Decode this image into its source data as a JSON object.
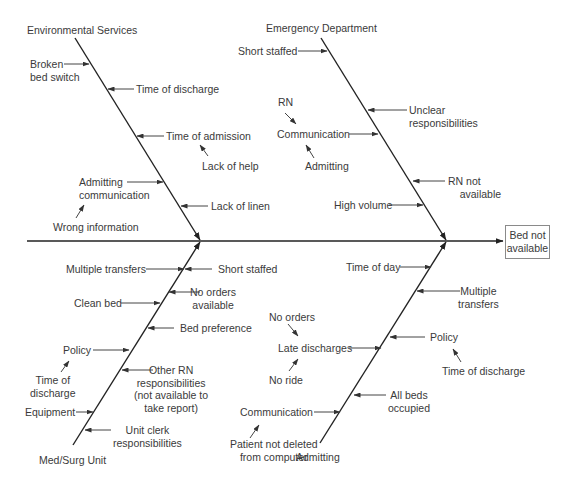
{
  "diagram": {
    "type": "fishbone",
    "effect": "Bed not\navailable",
    "categories": [
      {
        "name": "Environmental Services",
        "position": "top-left",
        "causes": [
          {
            "label": "Broken\nbed switch",
            "side": "left"
          },
          {
            "label": "Time of discharge",
            "side": "right"
          },
          {
            "label": "Time of admission",
            "side": "right",
            "sub_causes": [
              "Lack of help"
            ]
          },
          {
            "label": "Admitting\ncommunication",
            "side": "left",
            "sub_causes": [
              "Wrong information"
            ]
          },
          {
            "label": "Lack of linen",
            "side": "right"
          }
        ]
      },
      {
        "name": "Emergency Department",
        "position": "top-right",
        "causes": [
          {
            "label": "Short staffed",
            "side": "left"
          },
          {
            "label": "Unclear\nresponsibilities",
            "side": "right"
          },
          {
            "label": "Communication",
            "side": "left",
            "sub_causes": [
              "RN",
              "Admitting"
            ]
          },
          {
            "label": "RN not\navailable",
            "side": "right"
          },
          {
            "label": "High volume",
            "side": "left"
          }
        ]
      },
      {
        "name": "Med/Surg Unit",
        "position": "bottom-left",
        "causes": [
          {
            "label": "Multiple transfers",
            "side": "left"
          },
          {
            "label": "Short staffed",
            "side": "right"
          },
          {
            "label": "No orders\navailable",
            "side": "right"
          },
          {
            "label": "Clean bed",
            "side": "left"
          },
          {
            "label": "Bed preference",
            "side": "right"
          },
          {
            "label": "Policy",
            "side": "left",
            "sub_causes": [
              "Time of\ndischarge"
            ]
          },
          {
            "label": "Other RN\nresponsibilities\n(not available to\ntake report)",
            "side": "right"
          },
          {
            "label": "Equipment",
            "side": "left"
          },
          {
            "label": "Unit clerk\nresponsibilities",
            "side": "right"
          }
        ]
      },
      {
        "name": "Admitting",
        "position": "bottom-right",
        "causes": [
          {
            "label": "Time of day",
            "side": "left"
          },
          {
            "label": "Multiple\ntransfers",
            "side": "right"
          },
          {
            "label": "Policy",
            "side": "right",
            "sub_causes": [
              "Time of discharge"
            ]
          },
          {
            "label": "Late discharges",
            "side": "left",
            "sub_causes": [
              "No orders",
              "No ride"
            ]
          },
          {
            "label": "All beds\noccupied",
            "side": "right"
          },
          {
            "label": "Communication",
            "side": "left",
            "sub_causes": [
              "Patient not deleted\nfrom computer"
            ]
          }
        ]
      }
    ]
  },
  "labels": {
    "effect": "Bed not\navailable",
    "env": {
      "title": "Environmental Services",
      "broken": "Broken\nbed switch",
      "discharge": "Time of discharge",
      "admission": "Time of admission",
      "help": "Lack of help",
      "admit_comm": "Admitting\ncommunication",
      "wrong_info": "Wrong information",
      "linen": "Lack of linen"
    },
    "ed": {
      "title": "Emergency Department",
      "short": "Short staffed",
      "unclear": "Unclear\nresponsibilities",
      "rn": "RN",
      "comm": "Communication",
      "admitting": "Admitting",
      "rn_na": "RN not\n    available",
      "high": "High volume"
    },
    "ms": {
      "title": "Med/Surg Unit",
      "transfers": "Multiple transfers",
      "short": "Short staffed",
      "no_orders": "No orders\navailable",
      "clean": "Clean bed",
      "pref": "Bed preference",
      "policy": "Policy",
      "tod": "Time of\ndischarge",
      "other_rn": "Other RN\nresponsibilities\n(not available to\ntake report)",
      "equip": "Equipment",
      "clerk": "Unit clerk\nresponsibilities"
    },
    "adm": {
      "title": "Admitting",
      "tod": "Time of day",
      "transfers": "Multiple\ntransfers",
      "no_orders": "No orders",
      "late": "Late discharges",
      "no_ride": "No ride",
      "policy": "Policy",
      "tdis": "Time of discharge",
      "all_beds": "All beds\noccupied",
      "comm": "Communication",
      "patient": "Patient not deleted\nfrom computer"
    }
  },
  "colors": {
    "line": "#1a1a1a",
    "arrow": "#2a2a2a",
    "text": "#3a3a3a",
    "box_border": "#8a8a8a"
  }
}
